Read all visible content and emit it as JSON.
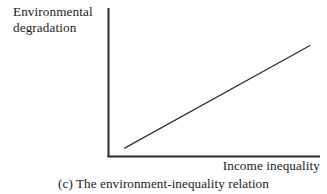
{
  "figure": {
    "caption": "(c) The environment-inequality relation",
    "y_axis_label_line1": "Environmental",
    "y_axis_label_line2": "degradation",
    "x_axis_label": "Income inequality",
    "axis_color": "#2b2b2b",
    "line_color": "#333333",
    "background_color": "#fefefe"
  },
  "chart_data": {
    "type": "line",
    "title": "(c) The environment-inequality relation",
    "xlabel": "Income inequality",
    "ylabel": "Environmental degradation",
    "x": [
      0.08,
      1.0
    ],
    "series": [
      {
        "name": "environment-inequality relation",
        "values": [
          0.06,
          0.79
        ]
      }
    ],
    "xlim": [
      0,
      1
    ],
    "ylim": [
      0,
      1
    ],
    "grid": false,
    "legend": false,
    "tick_labels": {
      "x": [],
      "y": []
    },
    "annotations": []
  }
}
